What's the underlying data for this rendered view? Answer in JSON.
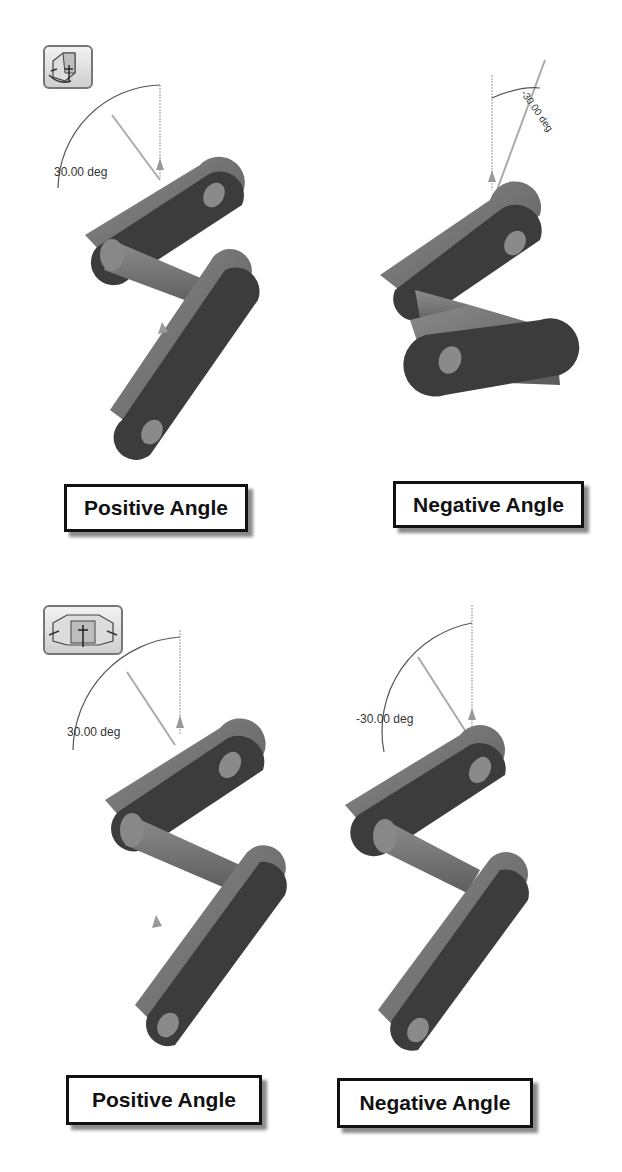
{
  "panels": [
    {
      "id": "top-left",
      "angle_label": "30.00 deg",
      "caption": "Positive Angle"
    },
    {
      "id": "top-right",
      "angle_label": "-30.00 deg",
      "caption": "Negative Angle"
    },
    {
      "id": "bottom-left",
      "angle_label": "30.00 deg",
      "caption": "Positive Angle"
    },
    {
      "id": "bottom-right",
      "angle_label": "-30.00 deg",
      "caption": "Negative Angle"
    }
  ],
  "icons": {
    "top": "rotate-view-single-icon",
    "bottom": "rotate-view-multi-icon"
  },
  "colors": {
    "part_face": "#3c3c3c",
    "part_side": "#707070",
    "hole": "#8a8a8a",
    "line": "#555555",
    "label_border": "#111111"
  }
}
